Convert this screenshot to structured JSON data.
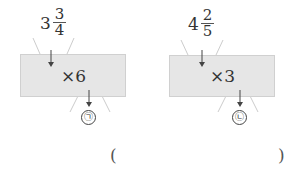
{
  "machines": [
    {
      "input": {
        "whole": "3",
        "numerator": "3",
        "denominator": "4"
      },
      "operation": "×6",
      "output_label": "㉠"
    },
    {
      "input": {
        "whole": "4",
        "numerator": "2",
        "denominator": "5"
      },
      "operation": "×3",
      "output_label": "㉡"
    }
  ],
  "answer": {
    "open_paren": "(",
    "close_paren": ")"
  },
  "colors": {
    "box_fill": "#e6e6e6",
    "funnel_line": "#cccccc",
    "arrow": "#444444"
  }
}
